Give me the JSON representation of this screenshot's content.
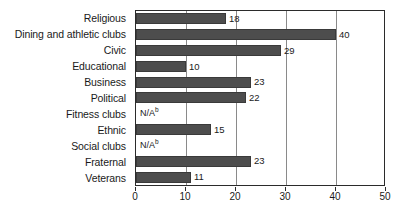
{
  "chart_data": {
    "type": "bar",
    "orientation": "horizontal",
    "title": "",
    "subtitle": "",
    "xlabel": "",
    "ylabel": "",
    "xlim": [
      0,
      50
    ],
    "xticks": [
      "0",
      "10",
      "20",
      "30",
      "40",
      "50"
    ],
    "grid": true,
    "legend": null,
    "bar_color": "#4d4d4d",
    "categories": [
      "Religious",
      "Dining and athletic clubs",
      "Civic",
      "Educational",
      "Business",
      "Political",
      "Fitness clubs",
      "Ethnic",
      "Social clubs",
      "Fraternal",
      "Veterans"
    ],
    "values": [
      18,
      40,
      29,
      10,
      23,
      22,
      null,
      15,
      null,
      23,
      11
    ],
    "value_labels": [
      "18",
      "40",
      "29",
      "10",
      "23",
      "22",
      "N/A",
      "15",
      "N/A",
      "23",
      "11"
    ],
    "missing_marker": "N/A",
    "missing_marker_footnote": "b"
  }
}
